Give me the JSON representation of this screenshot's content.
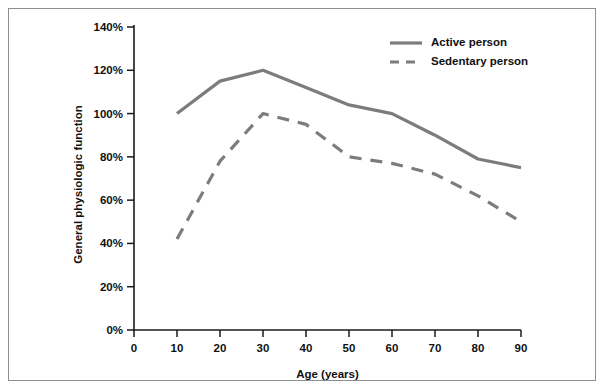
{
  "chart_data": {
    "type": "line",
    "title": "",
    "xlabel": "Age (years)",
    "ylabel": "General physiologic function",
    "xlim": [
      0,
      90
    ],
    "ylim": [
      0,
      140
    ],
    "grid": false,
    "legend_position": "top-right",
    "x_ticks": [
      "0",
      "10",
      "20",
      "30",
      "40",
      "50",
      "60",
      "70",
      "80",
      "90"
    ],
    "x_tick_values": [
      0,
      10,
      20,
      30,
      40,
      50,
      60,
      70,
      80,
      90
    ],
    "y_ticks": [
      "0%",
      "20%",
      "40%",
      "60%",
      "80%",
      "100%",
      "120%",
      "140%"
    ],
    "y_tick_values": [
      0,
      20,
      40,
      60,
      80,
      100,
      120,
      140
    ],
    "series": [
      {
        "name": "Active person",
        "style": "solid",
        "color": "#7c7c7c",
        "x": [
          10,
          20,
          30,
          40,
          50,
          60,
          70,
          80,
          90
        ],
        "values": [
          100,
          115,
          120,
          112,
          104,
          100,
          90,
          79,
          75
        ]
      },
      {
        "name": "Sedentary person",
        "style": "dashed",
        "color": "#7c7c7c",
        "x": [
          10,
          20,
          30,
          40,
          50,
          60,
          70,
          80,
          90
        ],
        "values": [
          42,
          78,
          100,
          95,
          80,
          77,
          72,
          62,
          50
        ]
      }
    ]
  },
  "legend": {
    "items": [
      {
        "label": "Active person",
        "style": "solid"
      },
      {
        "label": "Sedentary person",
        "style": "dashed"
      }
    ]
  },
  "axes": {
    "x_title": "Age (years)",
    "y_title": "General physiologic function"
  },
  "colors": {
    "line": "#7c7c7c",
    "axis": "#1a1a1a",
    "frame": "#8e8e8e",
    "background": "#ffffff",
    "text": "#111111"
  }
}
